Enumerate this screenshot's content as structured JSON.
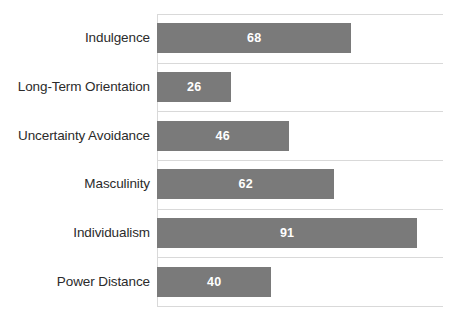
{
  "chart_data": {
    "type": "bar",
    "orientation": "horizontal",
    "title": "",
    "subtitle": "",
    "xlabel": "",
    "ylabel": "",
    "xlim": [
      0,
      100
    ],
    "grid": true,
    "grid_orientation": "horizontal-category-separators",
    "legend": false,
    "legend_position": "none",
    "bar_color": "#7a7a7a",
    "grid_color": "#d9d9d9",
    "label_color": "#2b2b2b",
    "value_label_color": "#ffffff",
    "background_color": "#ffffff",
    "categories": [
      "Indulgence",
      "Long-Term Orientation",
      "Uncertainty Avoidance",
      "Masculinity",
      "Individualism",
      "Power Distance"
    ],
    "values": [
      68,
      26,
      46,
      62,
      91,
      40
    ],
    "value_labels": [
      "68",
      "26",
      "46",
      "62",
      "91",
      "40"
    ],
    "series": [
      {
        "name": "",
        "values": [
          68,
          26,
          46,
          62,
          91,
          40
        ]
      }
    ],
    "tick_labels": {
      "x": [],
      "y": [
        "Indulgence",
        "Long-Term Orientation",
        "Uncertainty Avoidance",
        "Masculinity",
        "Individualism",
        "Power Distance"
      ]
    },
    "annotations": []
  }
}
